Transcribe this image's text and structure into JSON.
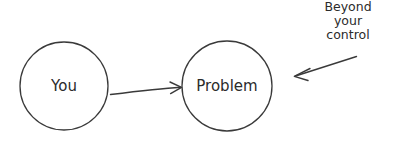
{
  "diagram": {
    "type": "node-arrow-diagram",
    "background_color": "#ffffff",
    "stroke_color": "#3a3a3a",
    "text_color": "#2b2b2b",
    "nodes": [
      {
        "id": "you",
        "label": "You",
        "shape": "circle",
        "cx": 64,
        "cy": 86,
        "r": 44
      },
      {
        "id": "problem",
        "label": "Problem",
        "shape": "circle",
        "cx": 227,
        "cy": 86,
        "r": 45
      }
    ],
    "edges": [
      {
        "id": "you-to-problem",
        "from": "you",
        "to": "problem",
        "label": "",
        "arrowhead": "end"
      }
    ],
    "annotations": [
      {
        "id": "beyond-your-control",
        "lines": [
          "Beyond",
          "your",
          "control"
        ],
        "align": "center",
        "pointer": "arrow",
        "points_to": "problem"
      }
    ]
  }
}
